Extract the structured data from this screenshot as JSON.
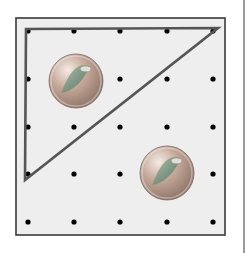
{
  "figure": {
    "background": "#ffffff",
    "board": {
      "x": 16,
      "y": 18,
      "width": 209,
      "height": 217,
      "fill": "#eeeeee",
      "border_color": "#3a3a3a"
    },
    "grid": {
      "columns": [
        28,
        74,
        120,
        167,
        213
      ],
      "rows": [
        31,
        79,
        127,
        174,
        222
      ],
      "peg_color": "#000000",
      "peg_radius": 2.6
    },
    "triangle": {
      "points": [
        [
          26,
          29
        ],
        [
          218,
          28
        ],
        [
          25,
          180
        ]
      ],
      "stroke": "#555555",
      "stroke_width": 2.6
    },
    "marbles": [
      {
        "cx": 76,
        "cy": 81,
        "r": 27,
        "body": "#b89a8a",
        "swirl": "#6f8f7a"
      },
      {
        "cx": 167,
        "cy": 173,
        "r": 27,
        "body": "#b89a8a",
        "swirl": "#6f8f7a"
      }
    ]
  }
}
